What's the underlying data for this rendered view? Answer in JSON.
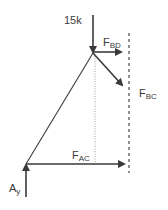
{
  "diagram": {
    "type": "free-body-diagram",
    "colors": {
      "line": "#3a3a3a",
      "dotted": "#9a9a9a",
      "dashed": "#4a4a4a"
    },
    "labels": {
      "load": "15k",
      "fbd_main": "F",
      "fbd_sub": "BD",
      "fbc_main": "F",
      "fbc_sub": "BC",
      "fac_main": "F",
      "fac_sub": "AC",
      "ay_main": "A",
      "ay_sub": "y"
    },
    "forces": [
      {
        "name": "15k",
        "direction": "down",
        "at": "joint-B"
      },
      {
        "name": "F_BD",
        "direction": "right",
        "at": "joint-B"
      },
      {
        "name": "F_BC",
        "direction": "down-right",
        "at": "joint-B"
      },
      {
        "name": "F_AC",
        "direction": "right",
        "at": "joint-A"
      },
      {
        "name": "A_y",
        "direction": "up",
        "at": "joint-A"
      }
    ],
    "section_cut": "dashed vertical line"
  }
}
